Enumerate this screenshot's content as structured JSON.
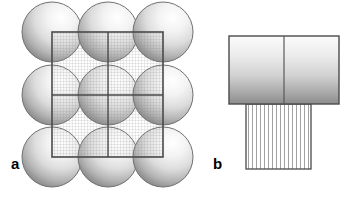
{
  "figure": {
    "width": 352,
    "height": 199,
    "background_color": "#ffffff",
    "panels": [
      {
        "id": "a",
        "label": "a",
        "label_x": 11,
        "label_y": 156,
        "description": "Close-packed 3x3 array of shaded spheres overlaid by a square grid-hatched unit cell divided into four quadrants",
        "spheres": {
          "count": 9,
          "rows": 3,
          "columns": 3,
          "radius": 30,
          "centers_x": [
            52,
            108,
            163
          ],
          "centers_y": [
            32,
            95,
            157
          ],
          "fill_light": "#ffffff",
          "fill_mid": "#e2e2e2",
          "fill_dark": "#8e8e8e",
          "outline_color": "#6e6e6e",
          "highlight_offset_x": "68%",
          "highlight_offset_y": "28%"
        },
        "unit_cell": {
          "x": 52,
          "y": 32,
          "width": 111,
          "height": 125,
          "outline_color": "#4a4a4a",
          "outline_width": 1.6,
          "divider_x": 108,
          "divider_y": 95,
          "hatch_type": "cross-grid",
          "hatch_spacing": 3,
          "hatch_color": "#8c8c8c",
          "hatch_opacity": 0.55
        }
      },
      {
        "id": "b",
        "label": "b",
        "label_x": 213,
        "label_y": 156,
        "description": "Gradient-filled rectangle split into two halves by a vertical line, with a vertically hatched rectangle attached beneath",
        "top_rect": {
          "x": 229,
          "y": 36,
          "width": 110,
          "height": 68,
          "divider_x": 284,
          "outline_color": "#4a4a4a",
          "outline_width": 1.4,
          "gradient_top": "#fbfbfb",
          "gradient_mid": "#d6d6d6",
          "gradient_bottom": "#8f8f8f"
        },
        "bottom_rect": {
          "x": 246,
          "y": 104,
          "width": 65,
          "height": 65,
          "outline_color": "#4a4a4a",
          "outline_width": 1.4,
          "hatch_type": "vertical-lines",
          "hatch_spacing": 4,
          "hatch_color": "#8a8a8a",
          "fill_color": "#ffffff"
        }
      }
    ]
  }
}
